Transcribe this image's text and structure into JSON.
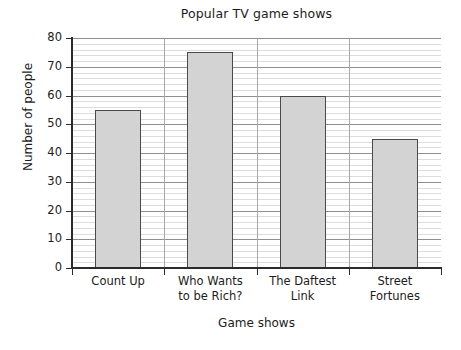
{
  "chart_data": {
    "type": "bar",
    "title": "Popular TV game shows",
    "xlabel": "Game shows",
    "ylabel": "Number of people",
    "categories": [
      "Count Up",
      "Who Wants to be Rich?",
      "The Daftest Link",
      "Street Fortunes"
    ],
    "category_lines": [
      [
        "Count Up"
      ],
      [
        "Who Wants",
        "to be Rich?"
      ],
      [
        "The Daftest",
        "Link"
      ],
      [
        "Street",
        "Fortunes"
      ]
    ],
    "values": [
      55,
      75,
      60,
      45
    ],
    "ylim": [
      0,
      80
    ],
    "ytick_step": 10,
    "yticks": [
      0,
      10,
      20,
      30,
      40,
      50,
      60,
      70,
      80
    ],
    "ytick_labels": [
      "0",
      "10",
      "20",
      "30",
      "40",
      "50",
      "60",
      "70",
      "80"
    ],
    "minor_gridline_step": 2,
    "grid": "horizontal-major-and-minor, vertical-category-separators",
    "legend": "none",
    "bar_fill_color": "#d3d3d3",
    "bar_border_color": "#4a4a4a",
    "major_gridline_color": "#8f8f8f",
    "minor_gridline_color": "#dcdcdc",
    "axis_color": "#2b2b2b",
    "background_color": "#ffffff"
  }
}
